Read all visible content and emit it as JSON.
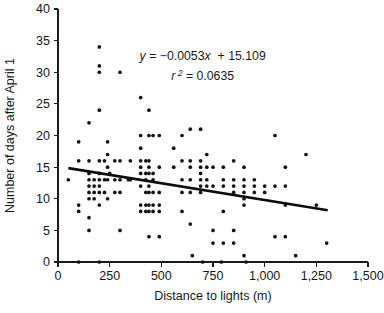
{
  "chart_data": {
    "type": "scatter",
    "title": "",
    "xlabel": "Distance to lights (m)",
    "ylabel": "Number of days after April 1",
    "xlim": [
      0,
      1500
    ],
    "ylim": [
      0,
      40
    ],
    "xticks": [
      0,
      250,
      500,
      750,
      1000,
      1250,
      1500
    ],
    "xtick_labels": [
      "0",
      "250",
      "500",
      "750",
      "1,000",
      "1,250",
      "1,500"
    ],
    "yticks": [
      0,
      5,
      10,
      15,
      20,
      25,
      30,
      35,
      40
    ],
    "ytick_labels": [
      "0",
      "5",
      "10",
      "15",
      "20",
      "25",
      "30",
      "35",
      "40"
    ],
    "grid": false,
    "legend": "none",
    "marker": "filled-circle",
    "marker_color": "#131313",
    "trendline": {
      "type": "linear",
      "slope": -0.0053,
      "intercept": 15.109,
      "r_squared": 0.0635,
      "x_start": 50,
      "x_end": 1305,
      "color": "#0d0d0d"
    },
    "annotations": [
      {
        "id": "regression-equation",
        "text": "y  = −0.0053x  + 15.109",
        "x": 700,
        "y": 32
      },
      {
        "id": "r-squared",
        "text": "r 2 = 0.0635",
        "x": 700,
        "y": 28.8
      }
    ],
    "points": [
      [
        50,
        13
      ],
      [
        100,
        19
      ],
      [
        100,
        16
      ],
      [
        100,
        9
      ],
      [
        100,
        8
      ],
      [
        100,
        0
      ],
      [
        150,
        22
      ],
      [
        150,
        16
      ],
      [
        150,
        14
      ],
      [
        150,
        13
      ],
      [
        150,
        12
      ],
      [
        150,
        11
      ],
      [
        150,
        10
      ],
      [
        150,
        7
      ],
      [
        150,
        5
      ],
      [
        175,
        13
      ],
      [
        175,
        12
      ],
      [
        175,
        11
      ],
      [
        175,
        10
      ],
      [
        200,
        34
      ],
      [
        200,
        31
      ],
      [
        200,
        30
      ],
      [
        200,
        24
      ],
      [
        200,
        16
      ],
      [
        200,
        14
      ],
      [
        200,
        13
      ],
      [
        200,
        12
      ],
      [
        200,
        11
      ],
      [
        200,
        9
      ],
      [
        200,
        0
      ],
      [
        225,
        16
      ],
      [
        225,
        13
      ],
      [
        225,
        11
      ],
      [
        240,
        19
      ],
      [
        240,
        17
      ],
      [
        240,
        15
      ],
      [
        240,
        13
      ],
      [
        240,
        10
      ],
      [
        250,
        14
      ],
      [
        275,
        16
      ],
      [
        275,
        13
      ],
      [
        275,
        11
      ],
      [
        300,
        30
      ],
      [
        300,
        16
      ],
      [
        300,
        13
      ],
      [
        300,
        11
      ],
      [
        300,
        5
      ],
      [
        340,
        13
      ],
      [
        350,
        16
      ],
      [
        350,
        13
      ],
      [
        400,
        26
      ],
      [
        400,
        20
      ],
      [
        400,
        18
      ],
      [
        400,
        16
      ],
      [
        400,
        15
      ],
      [
        400,
        14
      ],
      [
        400,
        12
      ],
      [
        400,
        9
      ],
      [
        400,
        8
      ],
      [
        425,
        16
      ],
      [
        425,
        14
      ],
      [
        425,
        13
      ],
      [
        425,
        11
      ],
      [
        425,
        9
      ],
      [
        425,
        8
      ],
      [
        440,
        24
      ],
      [
        440,
        20
      ],
      [
        440,
        16
      ],
      [
        440,
        15
      ],
      [
        440,
        14
      ],
      [
        440,
        12
      ],
      [
        440,
        11
      ],
      [
        440,
        9
      ],
      [
        440,
        8
      ],
      [
        440,
        4
      ],
      [
        460,
        20
      ],
      [
        460,
        14
      ],
      [
        460,
        13
      ],
      [
        460,
        11
      ],
      [
        460,
        9
      ],
      [
        460,
        8
      ],
      [
        490,
        20
      ],
      [
        490,
        15
      ],
      [
        490,
        11
      ],
      [
        490,
        9
      ],
      [
        490,
        8
      ],
      [
        490,
        4
      ],
      [
        560,
        18
      ],
      [
        560,
        15
      ],
      [
        600,
        20
      ],
      [
        600,
        16
      ],
      [
        600,
        13
      ],
      [
        600,
        11
      ],
      [
        600,
        8
      ],
      [
        640,
        21
      ],
      [
        640,
        16
      ],
      [
        640,
        15
      ],
      [
        640,
        13
      ],
      [
        640,
        11
      ],
      [
        640,
        6
      ],
      [
        650,
        1
      ],
      [
        690,
        21
      ],
      [
        690,
        16
      ],
      [
        690,
        15
      ],
      [
        690,
        14
      ],
      [
        690,
        13
      ],
      [
        690,
        12
      ],
      [
        690,
        11
      ],
      [
        700,
        0
      ],
      [
        720,
        17
      ],
      [
        720,
        15
      ],
      [
        720,
        13
      ],
      [
        720,
        12
      ],
      [
        750,
        15
      ],
      [
        750,
        12
      ],
      [
        750,
        5
      ],
      [
        750,
        3
      ],
      [
        790,
        0
      ],
      [
        800,
        15
      ],
      [
        800,
        13
      ],
      [
        800,
        12
      ],
      [
        800,
        8
      ],
      [
        800,
        3
      ],
      [
        850,
        16
      ],
      [
        850,
        13
      ],
      [
        850,
        12
      ],
      [
        850,
        11
      ],
      [
        850,
        5
      ],
      [
        850,
        3
      ],
      [
        900,
        15
      ],
      [
        900,
        13
      ],
      [
        900,
        12
      ],
      [
        900,
        11
      ],
      [
        900,
        10
      ],
      [
        900,
        9
      ],
      [
        900,
        1
      ],
      [
        910,
        0
      ],
      [
        950,
        13
      ],
      [
        950,
        12
      ],
      [
        950,
        11
      ],
      [
        1000,
        12
      ],
      [
        1000,
        11
      ],
      [
        1050,
        20
      ],
      [
        1050,
        12
      ],
      [
        1050,
        4
      ],
      [
        1100,
        15
      ],
      [
        1100,
        12
      ],
      [
        1100,
        9
      ],
      [
        1100,
        4
      ],
      [
        1150,
        1
      ],
      [
        1200,
        17
      ],
      [
        1250,
        9
      ],
      [
        1300,
        3
      ]
    ]
  }
}
